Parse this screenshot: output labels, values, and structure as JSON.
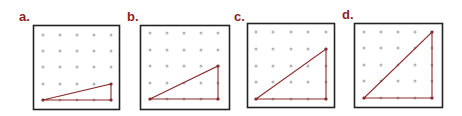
{
  "colors": {
    "label": "#8b1e1e",
    "line": "#8b2a2a",
    "dot": "#b5b5b5",
    "frame": "#222222"
  },
  "panels": [
    {
      "label": "a.",
      "label_pos": [
        19,
        10
      ],
      "box": [
        33,
        25,
        86,
        84
      ],
      "dots_x": [
        43,
        60,
        77,
        94,
        111
      ],
      "dots_y": [
        35,
        51,
        67,
        84,
        100
      ],
      "triangle": [
        [
          0,
          4
        ],
        [
          4,
          4
        ],
        [
          4,
          3
        ]
      ]
    },
    {
      "label": "b.",
      "label_pos": [
        127,
        10
      ],
      "box": [
        140,
        25,
        89,
        84
      ],
      "dots_x": [
        150,
        167,
        184,
        201,
        218
      ],
      "dots_y": [
        33,
        50,
        66,
        83,
        99
      ],
      "triangle": [
        [
          0,
          4
        ],
        [
          4,
          4
        ],
        [
          4,
          2
        ]
      ]
    },
    {
      "label": "c.",
      "label_pos": [
        234,
        10
      ],
      "box": [
        247,
        23,
        87,
        84
      ],
      "dots_x": [
        256,
        273,
        291,
        308,
        326
      ],
      "dots_y": [
        32,
        49,
        66,
        82,
        99
      ],
      "triangle": [
        [
          0,
          4
        ],
        [
          4,
          4
        ],
        [
          4,
          1
        ]
      ]
    },
    {
      "label": "d.",
      "label_pos": [
        342,
        8
      ],
      "box": [
        354,
        23,
        88,
        84
      ],
      "dots_x": [
        364,
        381,
        398,
        415,
        432
      ],
      "dots_y": [
        32,
        48,
        65,
        81,
        98
      ],
      "triangle": [
        [
          0,
          4
        ],
        [
          4,
          4
        ],
        [
          4,
          0
        ]
      ]
    }
  ]
}
